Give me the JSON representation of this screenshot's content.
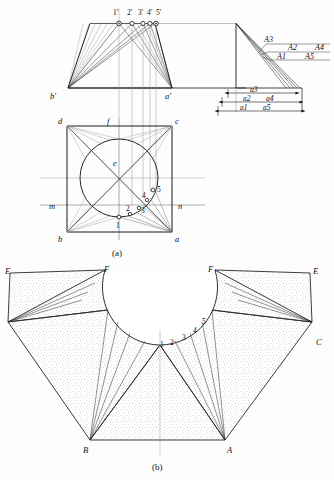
{
  "figure": {
    "captions": {
      "top": "(a)",
      "bottom": "(b)"
    }
  },
  "front_view": {
    "name": "front-view",
    "apex_points": [
      "1'",
      "2'",
      "3'",
      "4'",
      "5'"
    ],
    "corner_left": "b'",
    "corner_right": "a'"
  },
  "true_length_diagram": {
    "name": "true-length-diagram",
    "element_labels": [
      "A3",
      "A2",
      "A4",
      "A1",
      "A5"
    ],
    "rows": [
      {
        "label_left": "A3",
        "label_right": ""
      },
      {
        "label_left": "A2",
        "label_right": "A4"
      },
      {
        "label_left": "A1",
        "label_right": "A5"
      }
    ],
    "dimensions": [
      {
        "label_left": "a3",
        "label_right": ""
      },
      {
        "label_left": "a2",
        "label_right": "a4"
      },
      {
        "label_left": "a1",
        "label_right": "a5"
      }
    ]
  },
  "plan_view": {
    "name": "plan-view",
    "corners": {
      "top_left": "d",
      "top_right": "c",
      "bottom_left": "b",
      "bottom_right": "a"
    },
    "mid_labels": {
      "top": "f",
      "left": "m",
      "right": "n",
      "center": "e"
    },
    "circle_points": [
      "1",
      "2",
      "3",
      "4",
      "5"
    ]
  },
  "development": {
    "name": "development-pattern",
    "outer_labels": {
      "far_left": "E",
      "left_inner": "F",
      "right_inner": "F",
      "far_right": "E",
      "bottom_left": "B",
      "bottom_right": "A",
      "right": "C"
    },
    "arc_points": [
      "1",
      "2",
      "3",
      "4",
      "5"
    ]
  },
  "colors": {
    "line": "#1a1a1a",
    "thin_line": "#6b6b6b",
    "construction": "#9a9a9a",
    "hatch": "#8a8a8a",
    "paper": "#fdfdfd"
  }
}
